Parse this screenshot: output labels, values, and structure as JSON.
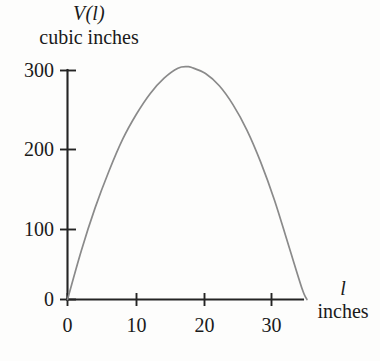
{
  "figure": {
    "background_color": "#fdfdfc",
    "axis_color": "#242424",
    "curve_color": "#8a8a8a"
  },
  "axes": {
    "y_title_function": "V(l)",
    "y_title_units": "cubic inches",
    "x_title_variable": "l",
    "x_title_units": "inches",
    "y_ticks": [
      "0",
      "100",
      "200",
      "300"
    ],
    "x_ticks": [
      "0",
      "10",
      "20",
      "30"
    ]
  },
  "chart_data": {
    "type": "line",
    "title": "",
    "subtitle": "",
    "xlabel": "l inches",
    "ylabel": "V(l) cubic inches",
    "xlim": [
      0,
      34.7
    ],
    "ylim": [
      0,
      310
    ],
    "grid": false,
    "legend": false,
    "legend_position": "none",
    "x_tick_values": [
      0,
      10,
      20,
      30
    ],
    "y_tick_values": [
      0,
      100,
      200,
      300
    ],
    "annotations": [],
    "series": [
      {
        "name": "V(l)",
        "color": "#8a8a8a",
        "roots": [
          0,
          34.7
        ],
        "peak": {
          "x": 17.4,
          "y": 305
        },
        "x": [
          0,
          2,
          4,
          6,
          8,
          10,
          12,
          14,
          16,
          17.35,
          18,
          20,
          22,
          24,
          26,
          28,
          30,
          32,
          34,
          34.7
        ],
        "values": [
          0,
          64,
          120,
          168,
          210,
          243,
          270,
          290,
          303,
          305,
          304,
          296,
          280,
          255,
          222,
          180,
          130,
          72,
          14,
          0
        ]
      }
    ]
  }
}
